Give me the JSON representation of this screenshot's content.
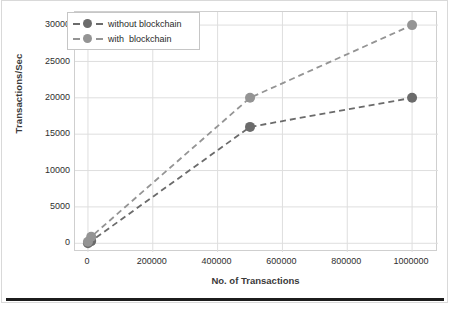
{
  "chart_data": {
    "type": "line",
    "title": "",
    "subtitle": "",
    "xlabel": "No. of Transactions",
    "ylabel": "Transactions/Sec",
    "xlim": [
      -40000,
      1080000
    ],
    "ylim": [
      -1200,
      31800
    ],
    "xticks": [
      0,
      200000,
      400000,
      600000,
      800000,
      1000000
    ],
    "xtick_labels": [
      "0",
      "200000",
      "400000",
      "600000",
      "800000",
      "1000000"
    ],
    "yticks": [
      0,
      5000,
      10000,
      15000,
      20000,
      25000,
      30000
    ],
    "ytick_labels": [
      "0",
      "5000",
      "10000",
      "15000",
      "20000",
      "25000",
      "30000"
    ],
    "grid": true,
    "legend_position": "upper left",
    "linestyle": "dashed",
    "marker": "circle",
    "series": [
      {
        "name": "without blockchain",
        "color": "#6b6b6b",
        "x": [
          0,
          10000,
          500000,
          1000000
        ],
        "y": [
          0,
          300,
          16000,
          20000
        ]
      },
      {
        "name": "with  blockchain",
        "color": "#949494",
        "x": [
          0,
          10000,
          500000,
          1000000
        ],
        "y": [
          200,
          900,
          20000,
          30000
        ]
      }
    ]
  },
  "legend": {
    "items": [
      {
        "label": "without blockchain",
        "color": "#6b6b6b"
      },
      {
        "label": "with  blockchain",
        "color": "#949494"
      }
    ]
  },
  "axes": {
    "y_title": "Transactions/Sec",
    "x_title": "No. of Transactions"
  }
}
